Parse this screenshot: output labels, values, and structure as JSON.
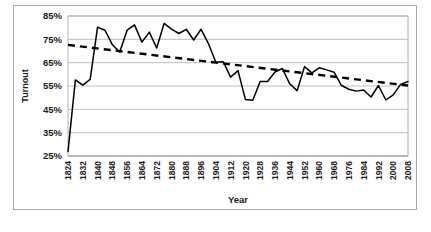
{
  "chart_data": {
    "type": "line",
    "title": "",
    "xlabel": "Year",
    "ylabel": "Turnout",
    "ylim": [
      25,
      85
    ],
    "xlim": [
      1824,
      2008
    ],
    "ytick_labels": [
      "25%",
      "35%",
      "45%",
      "55%",
      "65%",
      "75%",
      "85%"
    ],
    "ytick_values": [
      25,
      35,
      45,
      55,
      65,
      75,
      85
    ],
    "xtick_labels": [
      "1824",
      "1832",
      "1840",
      "1848",
      "1856",
      "1864",
      "1872",
      "1880",
      "1888",
      "1896",
      "1904",
      "1912",
      "1920",
      "1928",
      "1936",
      "1944",
      "1952",
      "1960",
      "1968",
      "1976",
      "1984",
      "1992",
      "2000",
      "2008"
    ],
    "xtick_values": [
      1824,
      1832,
      1840,
      1848,
      1856,
      1864,
      1872,
      1880,
      1888,
      1896,
      1904,
      1912,
      1920,
      1928,
      1936,
      1944,
      1952,
      1960,
      1968,
      1976,
      1984,
      1992,
      2000,
      2008
    ],
    "grid": true,
    "legend": "none",
    "series": [
      {
        "name": "Turnout",
        "style": "solid",
        "color": "#000000",
        "x": [
          1824,
          1828,
          1832,
          1836,
          1840,
          1844,
          1848,
          1852,
          1856,
          1860,
          1864,
          1868,
          1872,
          1876,
          1880,
          1884,
          1888,
          1892,
          1896,
          1900,
          1904,
          1908,
          1912,
          1916,
          1920,
          1924,
          1928,
          1932,
          1936,
          1940,
          1944,
          1948,
          1952,
          1956,
          1960,
          1964,
          1968,
          1972,
          1976,
          1980,
          1984,
          1988,
          1992,
          1996,
          2000,
          2004,
          2008
        ],
        "values": [
          26.9,
          57.6,
          55.4,
          57.8,
          80.2,
          78.9,
          72.7,
          69.6,
          78.9,
          81.2,
          73.8,
          78.1,
          71.3,
          81.8,
          79.4,
          77.5,
          79.3,
          74.7,
          79.3,
          73.2,
          65.2,
          65.4,
          58.8,
          61.6,
          49.2,
          48.9,
          56.9,
          56.9,
          61.0,
          62.5,
          55.9,
          53.0,
          63.3,
          60.6,
          62.8,
          61.9,
          60.9,
          55.2,
          53.6,
          52.8,
          53.3,
          50.3,
          55.2,
          49.0,
          51.2,
          55.7,
          56.9
        ]
      },
      {
        "name": "Linear trend",
        "style": "dashed",
        "color": "#000000",
        "x": [
          1824,
          2008
        ],
        "values": [
          72.6,
          55.2
        ]
      }
    ]
  }
}
